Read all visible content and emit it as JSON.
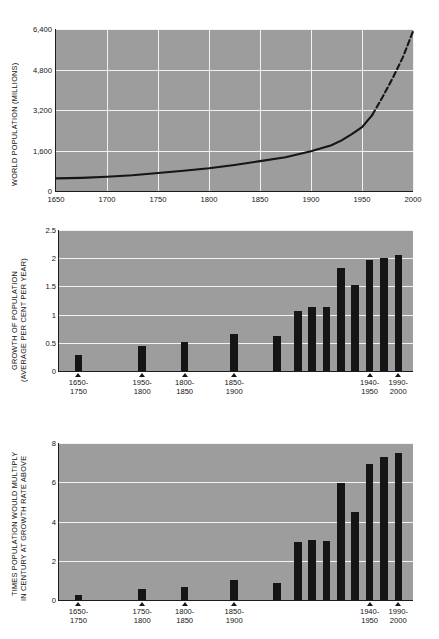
{
  "figure": {
    "background": "#ffffff",
    "plot_background": "#9d9d9d",
    "ink": "#151515",
    "grid_color": "#f2f2f2"
  },
  "chart_data": [
    {
      "id": "world-population",
      "type": "line",
      "title": "",
      "xlabel": "",
      "ylabel": "WORLD POPULATION (MILLIONS)",
      "xlim": [
        1650,
        2000
      ],
      "ylim": [
        0,
        6400
      ],
      "xticks": [
        1650,
        1700,
        1750,
        1800,
        1850,
        1900,
        1950,
        2000
      ],
      "xticklabels": [
        "1650",
        "1700",
        "1750",
        "1800",
        "1850",
        "1900",
        "1950",
        "2000"
      ],
      "yticks": [
        0,
        1600,
        3200,
        4800,
        6400
      ],
      "yticklabels": [
        "0",
        "1,600",
        "3,200",
        "4,800",
        "6,400"
      ],
      "grid": true,
      "legend": "none",
      "series": [
        {
          "name": "observed",
          "style": "solid",
          "x": [
            1650,
            1675,
            1700,
            1725,
            1750,
            1775,
            1800,
            1825,
            1850,
            1875,
            1900,
            1920,
            1930,
            1940,
            1950,
            1960
          ],
          "y": [
            500,
            520,
            560,
            620,
            710,
            800,
            900,
            1030,
            1180,
            1330,
            1570,
            1810,
            2000,
            2250,
            2520,
            3000
          ]
        },
        {
          "name": "projected",
          "style": "dashed",
          "x": [
            1960,
            1970,
            1980,
            1990,
            2000
          ],
          "y": [
            3000,
            3700,
            4450,
            5280,
            6300
          ]
        }
      ]
    },
    {
      "id": "growth-of-population",
      "type": "bar",
      "title": "",
      "xlabel": "",
      "ylabel": "GROWTH OF POPULATION\n(AVERAGE PER CENT PER YEAR)",
      "ylabel_line1": "GROWTH OF POPULATION",
      "ylabel_line2": "(AVERAGE PER CENT PER YEAR)",
      "ylim": [
        0,
        2.5
      ],
      "yticks": [
        0,
        0.5,
        1,
        1.5,
        2,
        2.5
      ],
      "yticklabels": [
        "0",
        "0.5",
        "1",
        "1.5",
        "2",
        "2.5"
      ],
      "grid": true,
      "legend": "none",
      "categories": [
        "1650-1750",
        "1950-1800",
        "1800-1850",
        "1850-1900",
        "1900-1940",
        "1940-1950",
        "1950-1960",
        "1960-1970",
        "1970-1980",
        "1980-1990",
        "1990-2000"
      ],
      "values": [
        0.28,
        0.44,
        0.51,
        0.66,
        0.62,
        1.07,
        1.14,
        1.13,
        1.82,
        1.53,
        1.96,
        2.0,
        2.05
      ],
      "bar_values": [
        0.28,
        0.44,
        0.51,
        0.66,
        0.62,
        1.07,
        1.14,
        1.13,
        1.82,
        1.53,
        1.96,
        2.0,
        2.05
      ],
      "marked_categories": [
        "1650-1750",
        "1950-1800",
        "1800-1850",
        "1850-1900",
        "1940-1950",
        "1990-2000"
      ],
      "tick_labels": [
        {
          "line1": "1650-",
          "line2": "1750"
        },
        {
          "line1": "1950-",
          "line2": "1800"
        },
        {
          "line1": "1800-",
          "line2": "1850"
        },
        {
          "line1": "1850-",
          "line2": "1900"
        },
        {
          "line1": "1940-",
          "line2": "1950"
        },
        {
          "line1": "1990-",
          "line2": "2000"
        }
      ]
    },
    {
      "id": "times-population-would-multiply",
      "type": "bar",
      "title": "",
      "xlabel": "",
      "ylabel_line1": "TIMES POPULATION WOULD MULTIPLY",
      "ylabel_line2": "IN CENTURY AT GROWTH RATE ABOVE",
      "ylim": [
        0,
        8
      ],
      "yticks": [
        0,
        2,
        4,
        6,
        8
      ],
      "yticklabels": [
        "0",
        "2",
        "4",
        "6",
        "8"
      ],
      "grid": true,
      "legend": "none",
      "categories": [
        "1650-1750",
        "1750-1800",
        "1800-1850",
        "1850-1900",
        "1900-1940",
        "1940-1950",
        "1950-1960",
        "1960-1970",
        "1970-1980",
        "1980-1990",
        "1990-2000"
      ],
      "values": [
        0.25,
        0.55,
        0.65,
        1.0,
        0.85,
        2.95,
        3.05,
        3.0,
        5.95,
        4.5,
        6.95,
        7.3,
        7.5
      ],
      "bar_values": [
        0.25,
        0.55,
        0.65,
        1.0,
        0.85,
        2.95,
        3.05,
        3.0,
        5.95,
        4.5,
        6.95,
        7.3,
        7.5
      ],
      "tick_labels": [
        {
          "line1": "1650-",
          "line2": "1750"
        },
        {
          "line1": "1750-",
          "line2": "1800"
        },
        {
          "line1": "1800-",
          "line2": "1850"
        },
        {
          "line1": "1850-",
          "line2": "1900"
        },
        {
          "line1": "1940-",
          "line2": "1950"
        },
        {
          "line1": "1990-",
          "line2": "2000"
        }
      ]
    }
  ]
}
